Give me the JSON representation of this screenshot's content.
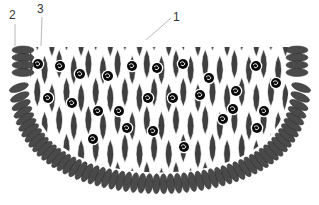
{
  "labels": [
    {
      "id": "1",
      "text": "1",
      "x": 173,
      "y": 11,
      "leader": [
        171,
        18,
        146,
        40
      ]
    },
    {
      "id": "2",
      "text": "2",
      "x": 9,
      "y": 9,
      "leader": [
        15,
        24,
        15,
        46
      ]
    },
    {
      "id": "3",
      "text": "3",
      "x": 37,
      "y": 3,
      "leader": [
        42,
        17,
        41,
        46
      ]
    }
  ],
  "colors": {
    "rim": "#4a4a4a",
    "lens": "#3f3f3f",
    "particle": "#0a0a0a",
    "background": "#ffffff",
    "leader": "#9a9a9a"
  },
  "geometry": {
    "center_x": 160,
    "top_y": 47,
    "bowl_half_width": 146,
    "bowl_depth": 148,
    "rim_disc_count": 58,
    "lens_cols": 20,
    "lens_rows": 5
  },
  "particles": [
    [
      38,
      64
    ],
    [
      60,
      66
    ],
    [
      80,
      74
    ],
    [
      108,
      76
    ],
    [
      132,
      66
    ],
    [
      157,
      68
    ],
    [
      183,
      64
    ],
    [
      209,
      78
    ],
    [
      236,
      91
    ],
    [
      256,
      66
    ],
    [
      276,
      83
    ],
    [
      48,
      98
    ],
    [
      72,
      103
    ],
    [
      98,
      111
    ],
    [
      119,
      111
    ],
    [
      148,
      98
    ],
    [
      173,
      98
    ],
    [
      200,
      95
    ],
    [
      233,
      109
    ],
    [
      264,
      111
    ],
    [
      93,
      139
    ],
    [
      127,
      128
    ],
    [
      153,
      131
    ],
    [
      184,
      147
    ],
    [
      223,
      119
    ],
    [
      257,
      128
    ]
  ]
}
